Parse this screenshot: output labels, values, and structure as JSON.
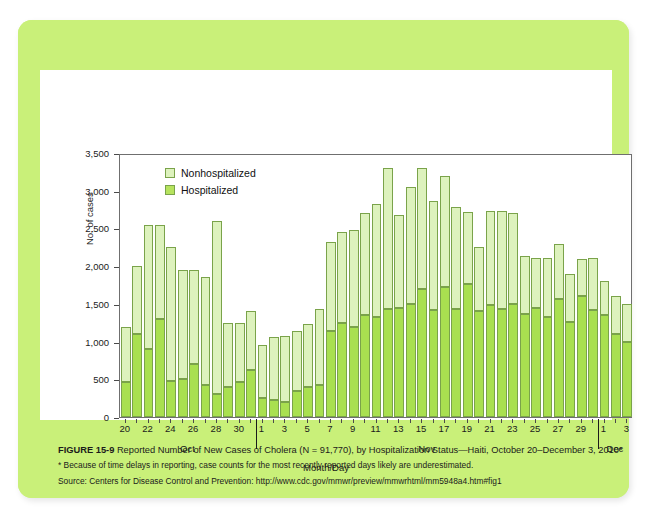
{
  "figure": {
    "number": "FIGURE 15-9",
    "caption": "Reported Number of New Cases of Cholera (N = 91,770), by Hospitalization Status—Haiti, October 20–December 3, 2010*",
    "footnote": "* Because of time delays in reporting, case counts for the most recently reported days likely are underestimated.",
    "source": "Source: Centers for Disease Control and Prevention: http://www.cdc.gov/mmwr/preview/mmwrhtml/mm5948a4.htm#fig1"
  },
  "colors": {
    "panel_background": "#c9f079",
    "card_background": "#ffffff",
    "hospitalized_fill": "#a9e050",
    "nonhospitalized_fill": "#ddf2bd",
    "bar_stroke": "#7aa34a",
    "axis": "#6f6f6f"
  },
  "legend": {
    "position": "top-left-inside",
    "entries": [
      {
        "label": "Nonhospitalized",
        "color": "#ddf2bd"
      },
      {
        "label": "Hospitalized",
        "color": "#b6e35e"
      }
    ]
  },
  "chart_data": {
    "type": "bar",
    "stacked": true,
    "title": "Reported Number of New Cases of Cholera (N = 91,770), by Hospitalization Status—Haiti, October 20–December 3, 2010",
    "xlabel": "Month/Day",
    "ylabel": "No. of cases",
    "ylim": [
      0,
      3500
    ],
    "yticks": [
      0,
      500,
      1000,
      1500,
      2000,
      2500,
      3000,
      3500
    ],
    "ytick_labels": [
      "0",
      "500",
      "1,000",
      "1,500",
      "2,000",
      "2,500",
      "3,000",
      "3,500"
    ],
    "grid": false,
    "categories": [
      "Oct 20",
      "Oct 21",
      "Oct 22",
      "Oct 23",
      "Oct 24",
      "Oct 25",
      "Oct 26",
      "Oct 27",
      "Oct 28",
      "Oct 29",
      "Oct 30",
      "Oct 31",
      "Nov 1",
      "Nov 2",
      "Nov 3",
      "Nov 4",
      "Nov 5",
      "Nov 6",
      "Nov 7",
      "Nov 8",
      "Nov 9",
      "Nov 10",
      "Nov 11",
      "Nov 12",
      "Nov 13",
      "Nov 14",
      "Nov 15",
      "Nov 16",
      "Nov 17",
      "Nov 18",
      "Nov 19",
      "Nov 20",
      "Nov 21",
      "Nov 22",
      "Nov 23",
      "Nov 24",
      "Nov 25",
      "Nov 26",
      "Nov 27",
      "Nov 28",
      "Nov 29",
      "Nov 30",
      "Dec 1",
      "Dec 2",
      "Dec 3"
    ],
    "xtick_labels": [
      "20",
      "",
      "22",
      "",
      "24",
      "",
      "26",
      "",
      "28",
      "",
      "30",
      "",
      "1",
      "",
      "3",
      "",
      "5",
      "",
      "7",
      "",
      "9",
      "",
      "11",
      "",
      "13",
      "",
      "15",
      "",
      "17",
      "",
      "19",
      "",
      "21",
      "",
      "23",
      "",
      "25",
      "",
      "27",
      "",
      "29",
      "",
      "1",
      "",
      "3"
    ],
    "month_groups": [
      {
        "label": "Oct",
        "start_index": 0,
        "end_index": 11
      },
      {
        "label": "Nov",
        "start_index": 12,
        "end_index": 41
      },
      {
        "label": "Dec",
        "start_index": 42,
        "end_index": 44
      }
    ],
    "series": [
      {
        "name": "Hospitalized",
        "color": "#a9e050",
        "values": [
          470,
          1100,
          900,
          1300,
          480,
          500,
          700,
          430,
          310,
          400,
          460,
          620,
          250,
          220,
          200,
          340,
          400,
          430,
          1140,
          1250,
          1200,
          1350,
          1330,
          1430,
          1450,
          1500,
          1700,
          1420,
          1730,
          1430,
          1760,
          1400,
          1480,
          1430,
          1500,
          1370,
          1450,
          1320,
          1560,
          1260,
          1600,
          1420,
          1350,
          1100,
          1000
        ]
      },
      {
        "name": "Nonhospitalized",
        "color": "#ddf2bd",
        "values": [
          730,
          900,
          1650,
          1250,
          1770,
          1450,
          1250,
          1420,
          2290,
          840,
          790,
          780,
          700,
          840,
          880,
          800,
          830,
          1000,
          1180,
          1200,
          1280,
          1350,
          1500,
          1870,
          1230,
          1550,
          1600,
          1440,
          1470,
          1350,
          960,
          850,
          1250,
          1300,
          1200,
          770,
          660,
          790,
          730,
          640,
          490,
          690,
          450,
          500,
          500
        ]
      }
    ],
    "totals": [
      1200,
      2000,
      2550,
      2550,
      2250,
      1950,
      1950,
      1850,
      2600,
      1240,
      1250,
      1400,
      950,
      1060,
      1080,
      1140,
      1230,
      1430,
      2320,
      2450,
      2480,
      2700,
      2830,
      3300,
      2680,
      3050,
      3300,
      2860,
      3200,
      2780,
      2720,
      2250,
      2730,
      2730,
      2700,
      2140,
      2110,
      2110,
      2290,
      1900,
      2090,
      2110,
      1800,
      1600,
      1500
    ]
  }
}
